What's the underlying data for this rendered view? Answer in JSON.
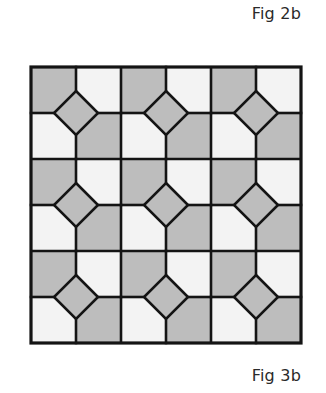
{
  "figure": {
    "caption_top": "Fig 2b",
    "caption_bottom": "Fig 3b"
  },
  "tiling": {
    "description": "3x3 arrangement of square blocks; each block is a 2x2 grid of cells with a central diamond (square rotated 45°) where the four cells meet. Top-left and bottom-right cells are shaded, top-right and bottom-left are light, diamond is shaded.",
    "origin": [
      31,
      67
    ],
    "blocks_x": 3,
    "blocks_y": 3,
    "block_width": 90,
    "block_height": 92,
    "diamond_half_diagonal": 22,
    "cell_pattern": [
      [
        "shaded",
        "light"
      ],
      [
        "light",
        "shaded"
      ]
    ],
    "diamond_fill": "shaded",
    "colors": {
      "shaded": "#bdbdbd",
      "light": "#f3f3f3",
      "line": "#141414",
      "background": "#ffffff"
    },
    "line_width": 2.6
  }
}
